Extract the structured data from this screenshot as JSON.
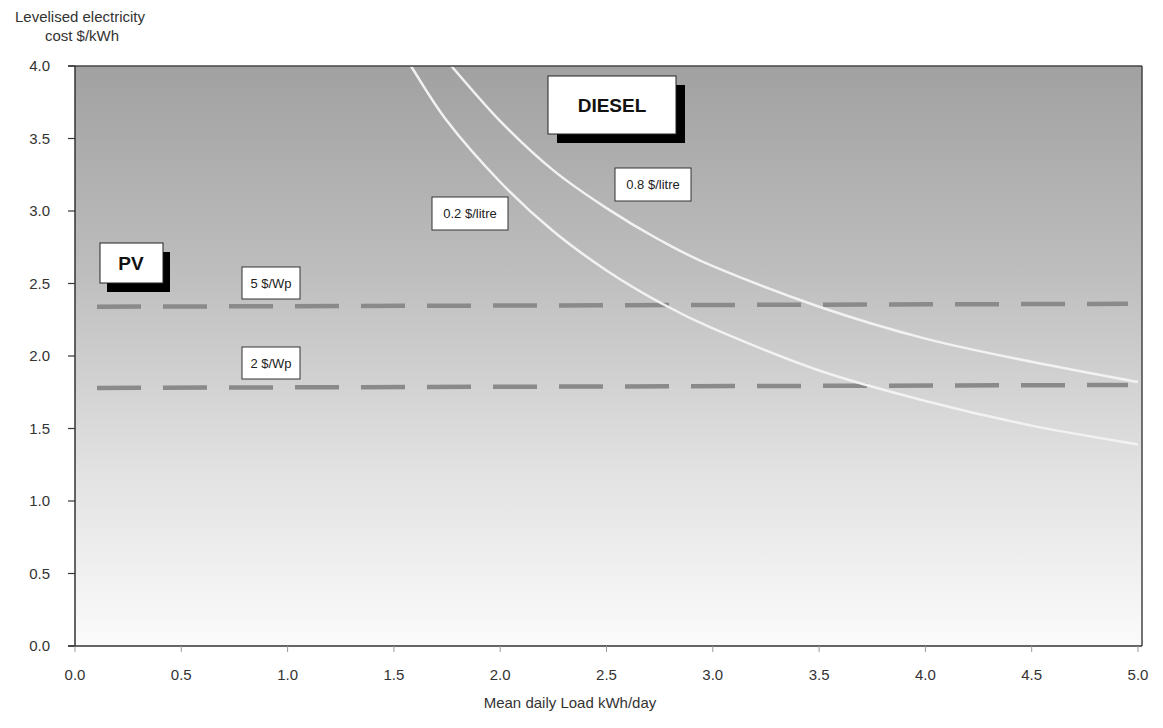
{
  "chart_data": {
    "type": "line",
    "title": "",
    "xlabel": "Mean daily Load  kWh/day",
    "ylabel_lines": [
      "Levelised electricity",
      "cost $/kWh"
    ],
    "xlim": [
      0.0,
      5.0
    ],
    "ylim": [
      0.0,
      4.0
    ],
    "x_ticks": [
      "0.0",
      "0.5",
      "1.0",
      "1.5",
      "2.0",
      "2.5",
      "3.0",
      "3.5",
      "4.0",
      "4.5",
      "5.0"
    ],
    "y_ticks": [
      "0.0",
      "0.5",
      "1.0",
      "1.5",
      "2.0",
      "2.5",
      "3.0",
      "3.5",
      "4.0"
    ],
    "grid": false,
    "background": "vertical gradient, dark grey (top) to white (bottom)",
    "group_labels": [
      {
        "text": "DIESEL",
        "x": 2.4,
        "y": 3.7
      },
      {
        "text": "PV",
        "x": 0.15,
        "y": 2.6
      }
    ],
    "series": [
      {
        "name": "5 $/Wp",
        "group": "PV",
        "style": "dashed",
        "color": "#8a8a8a",
        "x": [
          0.1,
          5.0
        ],
        "y": [
          2.34,
          2.36
        ]
      },
      {
        "name": "2 $/Wp",
        "group": "PV",
        "style": "dashed",
        "color": "#8a8a8a",
        "x": [
          0.1,
          5.0
        ],
        "y": [
          1.78,
          1.8
        ]
      },
      {
        "name": "0.2 $/litre",
        "group": "DIESEL",
        "style": "solid",
        "color": "#f2f2f2",
        "x": [
          1.58,
          1.75,
          2.0,
          2.25,
          2.5,
          2.75,
          3.0,
          3.5,
          4.0,
          4.5,
          5.0
        ],
        "y": [
          4.0,
          3.62,
          3.2,
          2.86,
          2.59,
          2.37,
          2.19,
          1.9,
          1.69,
          1.52,
          1.39
        ]
      },
      {
        "name": "0.8 $/litre",
        "group": "DIESEL",
        "style": "solid",
        "color": "#f2f2f2",
        "x": [
          1.77,
          2.0,
          2.25,
          2.5,
          2.75,
          3.0,
          3.5,
          4.0,
          4.5,
          5.0
        ],
        "y": [
          4.0,
          3.62,
          3.28,
          3.02,
          2.8,
          2.62,
          2.34,
          2.12,
          1.96,
          1.82
        ]
      }
    ],
    "annotations": [
      {
        "text": "5 $/Wp",
        "x": 0.8,
        "y": 2.5
      },
      {
        "text": "2 $/Wp",
        "x": 0.8,
        "y": 1.97
      },
      {
        "text": "0.2 $/litre",
        "x": 1.85,
        "y": 2.98
      },
      {
        "text": "0.8 $/litre",
        "x": 2.72,
        "y": 3.18
      }
    ]
  },
  "labels": {
    "ylabel_line1": "Levelised electricity",
    "ylabel_line2": "cost $/kWh",
    "xlabel": "Mean daily Load  kWh/day",
    "diesel": "DIESEL",
    "pv": "PV",
    "pv_5": "5 $/Wp",
    "pv_2": "2 $/Wp",
    "diesel_02": "0.2 $/litre",
    "diesel_08": "0.8 $/litre"
  },
  "colors": {
    "bg_top": "#a3a3a3",
    "bg_bottom": "#fbfbfb",
    "dash": "#8c8c8c",
    "curve": "#f4f4f4",
    "axis": "#333333"
  }
}
